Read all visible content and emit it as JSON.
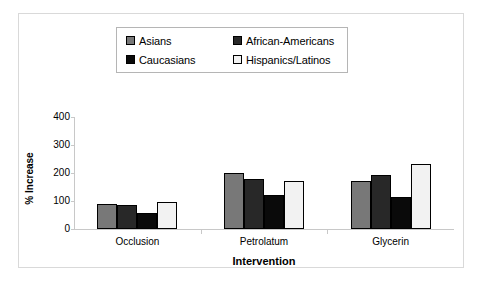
{
  "chart_data": {
    "type": "bar",
    "title": "",
    "xlabel": "Intervention",
    "ylabel": "% Increase",
    "categories": [
      "Occlusion",
      "Petrolatum",
      "Glycerin"
    ],
    "series": [
      {
        "name": "Asians",
        "color": "#787878",
        "values": [
          90,
          200,
          173
        ]
      },
      {
        "name": "African-Americans",
        "color": "#282828",
        "values": [
          85,
          178,
          193
        ]
      },
      {
        "name": "Caucasians",
        "color": "#0a0a0a",
        "values": [
          57,
          123,
          113
        ]
      },
      {
        "name": "Hispanics/Latinos",
        "color": "#f2f2f2",
        "values": [
          95,
          172,
          233
        ]
      }
    ],
    "ylim": [
      0,
      400
    ],
    "yticks": [
      0,
      100,
      200,
      300,
      400
    ],
    "ytick_labels": [
      "0",
      "100",
      "200",
      "300",
      "400"
    ],
    "grid": false,
    "legend_position": "top-center"
  },
  "legend": {
    "entries": [
      {
        "label": "Asians",
        "swatch": "legend-swatch-asians"
      },
      {
        "label": "African-Americans",
        "swatch": "legend-swatch-african-americans"
      },
      {
        "label": "Caucasians",
        "swatch": "legend-swatch-caucasians"
      },
      {
        "label": "Hispanics/Latinos",
        "swatch": "legend-swatch-hispanics-latinos"
      }
    ]
  },
  "colors": {
    "asians": "#787878",
    "african_americans": "#282828",
    "caucasians": "#0a0a0a",
    "hispanics_latinos": "#f2f2f2",
    "axis": "#c8c8c8",
    "frame": "#d9d9d9",
    "legend_border": "#b5b5b5",
    "text": "#000000"
  }
}
